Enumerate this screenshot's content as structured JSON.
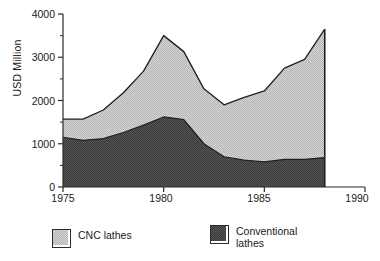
{
  "chart_data": {
    "type": "area",
    "stacked": true,
    "title": "",
    "subtitle": "",
    "xlabel": "",
    "ylabel": "USD Million",
    "xlim": [
      1975,
      1990
    ],
    "ylim": [
      0,
      4000
    ],
    "grid": false,
    "legend_position": "bottom",
    "x_ticks": [
      "1975",
      "1980",
      "1985",
      "1990"
    ],
    "x_tick_values": [
      1975,
      1980,
      1985,
      1990
    ],
    "y_ticks": [
      "0",
      "1000",
      "2000",
      "3000",
      "4000"
    ],
    "y_tick_values": [
      0,
      1000,
      2000,
      3000,
      4000
    ],
    "y_minor_ticks": [
      500,
      1500,
      2500,
      3500
    ],
    "x": [
      1975,
      1976,
      1977,
      1978,
      1979,
      1980,
      1981,
      1982,
      1983,
      1984,
      1985,
      1986,
      1987,
      1988
    ],
    "series": [
      {
        "name": "Conventional lathes",
        "color": "#4a4a4a",
        "values": [
          1150,
          1080,
          1120,
          1260,
          1430,
          1620,
          1560,
          1000,
          700,
          620,
          580,
          640,
          640,
          680
        ]
      },
      {
        "name": "CNC lathes",
        "color": "#c9c9c9",
        "values": [
          420,
          490,
          660,
          920,
          1250,
          1880,
          1570,
          1270,
          1200,
          1450,
          1640,
          2110,
          2310,
          2970
        ]
      }
    ],
    "totals": [
      1570,
      1570,
      1780,
      2180,
      2680,
      3500,
      3130,
      2270,
      1900,
      2070,
      2220,
      2750,
      2950,
      3650
    ],
    "annotations": []
  },
  "legend": {
    "entries": [
      {
        "label": "CNC lathes",
        "swatch_color": "#c9c9c9"
      },
      {
        "label": "Conventional\nlathes",
        "swatch_color": "#4a4a4a"
      }
    ]
  },
  "axes": {
    "y_title": "USD Million",
    "y_labels": [
      "4000",
      "3000",
      "2000",
      "1000",
      "0"
    ],
    "x_labels": [
      "1975",
      "1980",
      "1985",
      "1990"
    ]
  },
  "colors": {
    "cnc_fill": "#c9c9c9",
    "conventional_fill": "#4a4a4a",
    "axis": "#2b2b2b",
    "outline": "#1f1f1f",
    "background": "#ffffff"
  }
}
